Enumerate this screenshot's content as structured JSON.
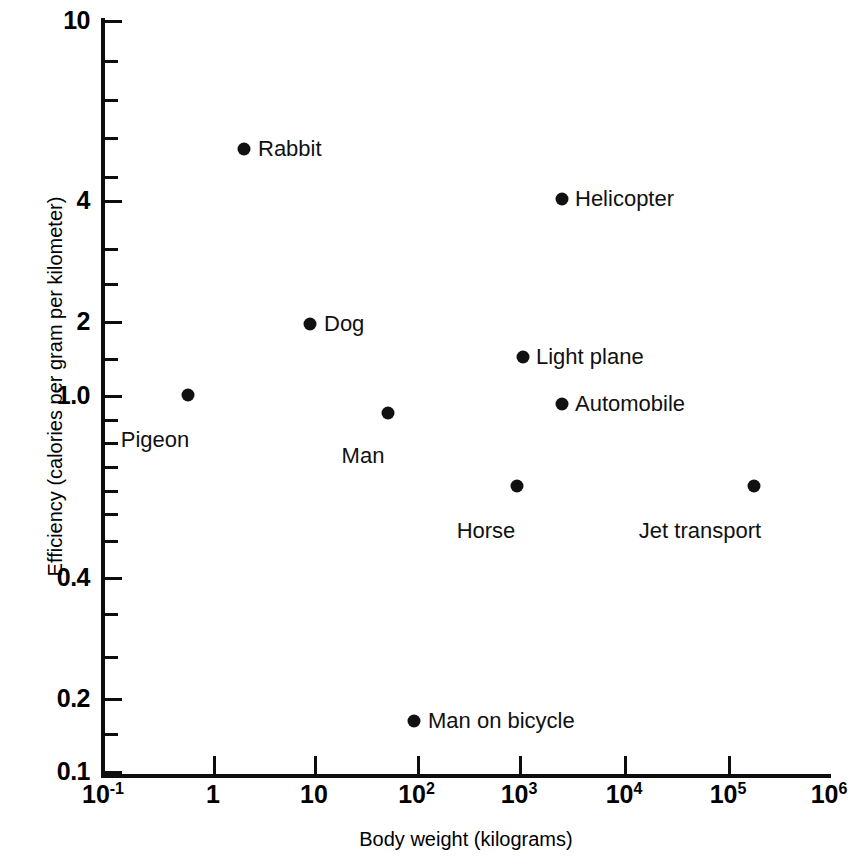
{
  "chart_data": {
    "type": "scatter",
    "title": "",
    "xlabel": "Body weight (kilograms)",
    "ylabel": "Efficiency (calories per gram per kilometer)",
    "xscale": "log",
    "yscale": "log",
    "xlim": [
      0.1,
      1000000
    ],
    "ylim": [
      0.1,
      10
    ],
    "grid": false,
    "legend": "none",
    "xticks": [
      "10^-1",
      "1",
      "10",
      "10^2",
      "10^3",
      "10^4",
      "10^5",
      "10^6"
    ],
    "yticks": [
      "10",
      "4",
      "2",
      "1.0",
      "0.4",
      "0.2",
      "0.1"
    ],
    "points": [
      {
        "label": "Pigeon",
        "x": 0.6,
        "y": 1.1
      },
      {
        "label": "Rabbit",
        "x": 2.2,
        "y": 4.6
      },
      {
        "label": "Dog",
        "x": 10,
        "y": 1.95
      },
      {
        "label": "Man",
        "x": 55,
        "y": 0.92
      },
      {
        "label": "Man on bicycle",
        "x": 100,
        "y": 0.17
      },
      {
        "label": "Horse",
        "x": 900,
        "y": 0.62
      },
      {
        "label": "Light plane",
        "x": 1000,
        "y": 1.5
      },
      {
        "label": "Helicopter",
        "x": 2400,
        "y": 4.0
      },
      {
        "label": "Automobile",
        "x": 2400,
        "y": 1.0
      },
      {
        "label": "Jet transport",
        "x": 180000,
        "y": 0.62
      }
    ]
  },
  "axes": {
    "y": {
      "title": "Efficiency (calories per gram per kilometer)",
      "labels": [
        {
          "text": "10",
          "top": 20
        },
        {
          "text": "4",
          "top": 200
        },
        {
          "text": "2",
          "top": 321
        },
        {
          "text": "1.0",
          "top": 395
        },
        {
          "text": "0.4",
          "top": 577
        },
        {
          "text": "0.2",
          "top": 698
        },
        {
          "text": "0.1",
          "top": 771
        }
      ],
      "ticks": [
        20,
        60,
        99,
        137,
        176,
        200,
        248,
        283,
        321,
        358,
        395,
        419,
        442,
        466,
        490,
        513,
        540,
        577,
        613,
        656,
        698,
        733,
        771
      ]
    },
    "x": {
      "title": "Body weight (kilograms)",
      "labels": [
        {
          "base": "10",
          "exp": "-1",
          "left": 103
        },
        {
          "base": "1",
          "exp": "",
          "left": 213
        },
        {
          "base": "10",
          "exp": "",
          "left": 314
        },
        {
          "base": "10",
          "exp": "2",
          "left": 417
        },
        {
          "base": "10",
          "exp": "3",
          "left": 519
        },
        {
          "base": "10",
          "exp": "4",
          "left": 624
        },
        {
          "base": "10",
          "exp": "5",
          "left": 728
        },
        {
          "base": "10",
          "exp": "6",
          "left": 829
        }
      ],
      "ticks": [
        213,
        314,
        417,
        519,
        624,
        728
      ]
    }
  },
  "plot": {
    "markers": [
      {
        "name": "pigeon",
        "text": "Pigeon",
        "cx": 188,
        "cy": 395,
        "lx": 155,
        "ly": 427,
        "pos": "below"
      },
      {
        "name": "rabbit",
        "text": "Rabbit",
        "cx": 244,
        "cy": 149,
        "lx": 258,
        "ly": 149,
        "pos": "right"
      },
      {
        "name": "dog",
        "text": "Dog",
        "cx": 310,
        "cy": 324,
        "lx": 324,
        "ly": 324,
        "pos": "right"
      },
      {
        "name": "man",
        "text": "Man",
        "cx": 388,
        "cy": 413,
        "lx": 363,
        "ly": 443,
        "pos": "below"
      },
      {
        "name": "man-on-bicycle",
        "text": "Man on bicycle",
        "cx": 414,
        "cy": 721,
        "lx": 428,
        "ly": 721,
        "pos": "right"
      },
      {
        "name": "horse",
        "text": "Horse",
        "cx": 517,
        "cy": 486,
        "lx": 486,
        "ly": 518,
        "pos": "below"
      },
      {
        "name": "light-plane",
        "text": "Light plane",
        "cx": 523,
        "cy": 357,
        "lx": 536,
        "ly": 357,
        "pos": "right"
      },
      {
        "name": "helicopter",
        "text": "Helicopter",
        "cx": 562,
        "cy": 199,
        "lx": 575,
        "ly": 199,
        "pos": "right"
      },
      {
        "name": "automobile",
        "text": "Automobile",
        "cx": 562,
        "cy": 404,
        "lx": 575,
        "ly": 404,
        "pos": "right"
      },
      {
        "name": "jet-transport",
        "text": "Jet transport",
        "cx": 754,
        "cy": 486,
        "lx": 700,
        "ly": 518,
        "pos": "below"
      }
    ]
  }
}
